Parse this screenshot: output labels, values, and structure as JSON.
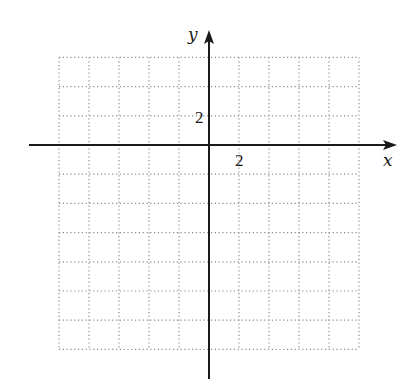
{
  "diagram": {
    "type": "coordinate-grid",
    "x_axis": {
      "label": "x",
      "tick_label": "2",
      "grid_columns_left_of_origin": 5,
      "grid_columns_right_of_origin": 5,
      "units_per_cell": 2
    },
    "y_axis": {
      "label": "y",
      "tick_label": "2",
      "grid_rows_above_origin": 3,
      "grid_rows_below_origin": 7,
      "units_per_cell": 2
    },
    "colors": {
      "axis": "#1a1a1a",
      "grid": "#8a8a8a",
      "background": "#ffffff"
    }
  }
}
